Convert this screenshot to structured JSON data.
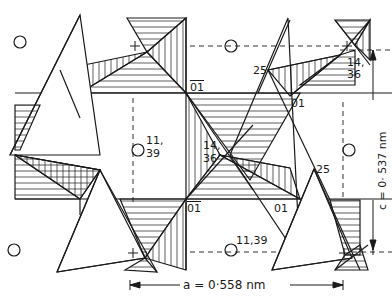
{
  "diagram": {
    "type": "crystal-structure-polyhedral-projection",
    "colors": {
      "line": "#1a1a1a",
      "background": "#ffffff"
    },
    "dimensions": {
      "a_label": "a  =  0·558 nm",
      "c_label": "c  =  0· 537 nm"
    },
    "atom_labels": {
      "top_left_01bar": "01",
      "top_right_25": "25",
      "top_right_01": "01",
      "top_right_14_36_a": "14,",
      "top_right_14_36_b": "36",
      "center_11_39_a": "11,",
      "center_11_39_b": "39",
      "center_14_36_a": "14,",
      "center_14_36_b": "36",
      "mid_right_25": "25",
      "bottom_01bar": "01",
      "bottom_01": "01",
      "bottom_11_39": "11,39"
    },
    "plus_markers": [
      "+",
      "+",
      "+",
      "+"
    ],
    "legend_symbols": {
      "open_circle": "atom-site",
      "plus": "above-plane marker"
    }
  }
}
